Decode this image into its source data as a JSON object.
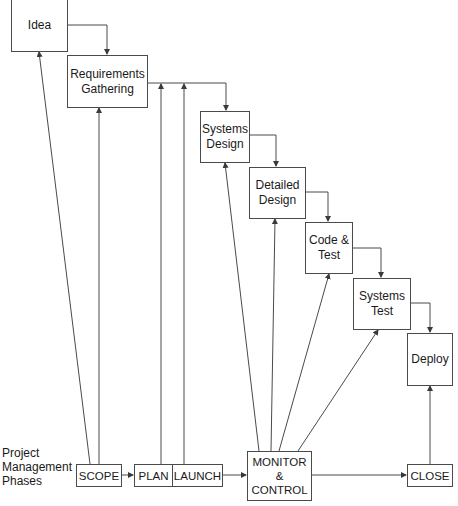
{
  "diagram": {
    "type": "waterfall-with-project-management-phases",
    "sdlc_stages": [
      {
        "id": "idea",
        "label": "Idea"
      },
      {
        "id": "requirements",
        "label": "Requirements\nGathering"
      },
      {
        "id": "systems_design",
        "label": "Systems\nDesign"
      },
      {
        "id": "detailed_design",
        "label": "Detailed\nDesign"
      },
      {
        "id": "code_test",
        "label": "Code &\nTest"
      },
      {
        "id": "systems_test",
        "label": "Systems\nTest"
      },
      {
        "id": "deploy",
        "label": "Deploy"
      }
    ],
    "pm_label": "Project\nManagement\nPhases",
    "pm_phases": [
      {
        "id": "scope",
        "label": "SCOPE"
      },
      {
        "id": "plan",
        "label": "PLAN"
      },
      {
        "id": "launch",
        "label": "LAUNCH"
      },
      {
        "id": "monitor",
        "label": "MONITOR\n&\nCONTROL"
      },
      {
        "id": "close",
        "label": "CLOSE"
      }
    ],
    "edges": [
      {
        "from": "idea",
        "to": "requirements"
      },
      {
        "from": "requirements",
        "to": "systems_design"
      },
      {
        "from": "systems_design",
        "to": "detailed_design"
      },
      {
        "from": "detailed_design",
        "to": "code_test"
      },
      {
        "from": "code_test",
        "to": "systems_test"
      },
      {
        "from": "systems_test",
        "to": "deploy"
      },
      {
        "from": "scope",
        "to": "plan"
      },
      {
        "from": "launch",
        "to": "monitor"
      },
      {
        "from": "monitor",
        "to": "close"
      },
      {
        "from": "scope",
        "to": "idea"
      },
      {
        "from": "scope",
        "to": "requirements"
      },
      {
        "from": "plan",
        "to": "requirements-systems_design-connector"
      },
      {
        "from": "launch",
        "to": "requirements-systems_design-connector"
      },
      {
        "from": "monitor",
        "to": "systems_design"
      },
      {
        "from": "monitor",
        "to": "detailed_design"
      },
      {
        "from": "monitor",
        "to": "code_test"
      },
      {
        "from": "monitor",
        "to": "systems_test"
      },
      {
        "from": "close",
        "to": "deploy"
      }
    ]
  },
  "colors": {
    "line": "#4a4a4a",
    "background": "#ffffff",
    "text": "#1a1a1a"
  }
}
